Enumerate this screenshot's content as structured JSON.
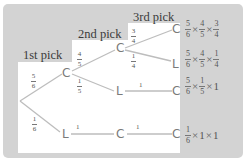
{
  "diagram": {
    "type": "probability-tree",
    "column_labels": [
      "1st pick",
      "2nd pick",
      "3rd pick"
    ],
    "nodes": {
      "n1_C": "C",
      "n1_L": "L",
      "n2_CC": "C",
      "n2_CL": "L",
      "n2_LC": "C",
      "n3_CCC": "C",
      "n3_CCL": "L",
      "n3_CLC": "C",
      "n3_LCC": "C"
    },
    "edges": {
      "root_C": {
        "num": "5",
        "den": "6"
      },
      "root_L": {
        "num": "1",
        "den": "6"
      },
      "C_C": {
        "num": "4",
        "den": "5"
      },
      "C_L": {
        "num": "1",
        "den": "5"
      },
      "L_C": "1",
      "CC_C": {
        "num": "3",
        "den": "4"
      },
      "CC_L": {
        "num": "1",
        "den": "4"
      },
      "CL_C": "1",
      "LC_C": "1"
    },
    "outcomes": [
      {
        "terms": [
          {
            "num": "5",
            "den": "6"
          },
          {
            "num": "4",
            "den": "5"
          },
          {
            "num": "3",
            "den": "4"
          }
        ],
        "times": "×"
      },
      {
        "terms": [
          {
            "num": "5",
            "den": "6"
          },
          {
            "num": "4",
            "den": "5"
          },
          {
            "num": "1",
            "den": "4"
          }
        ],
        "times": "×"
      },
      {
        "terms": [
          {
            "num": "5",
            "den": "6"
          },
          {
            "num": "1",
            "den": "5"
          }
        ],
        "tail": "1",
        "times": "×"
      },
      {
        "terms": [
          {
            "num": "1",
            "den": "6"
          }
        ],
        "tail1": "1",
        "tail2": "1",
        "times": "×"
      }
    ]
  }
}
